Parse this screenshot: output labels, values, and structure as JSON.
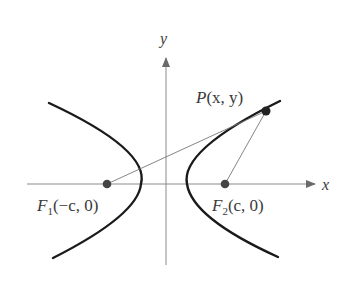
{
  "diagram": {
    "type": "hyperbola",
    "axes": {
      "x_label": "x",
      "y_label": "y"
    },
    "point": {
      "label": "P(x, y)",
      "name": "P",
      "coords": "(x, y)"
    },
    "foci": [
      {
        "label": "F1(−c, 0)",
        "name": "F",
        "sub": "1",
        "coords": "(−c, 0)"
      },
      {
        "label": "F2(c, 0)",
        "name": "F",
        "sub": "2",
        "coords": "(c, 0)"
      }
    ],
    "colors": {
      "curve": "#1a1a1a",
      "axis": "#7a7a7a",
      "segment": "#6a6a6a",
      "point": "#2a2a2a",
      "focus": "#4a4a4a"
    }
  }
}
